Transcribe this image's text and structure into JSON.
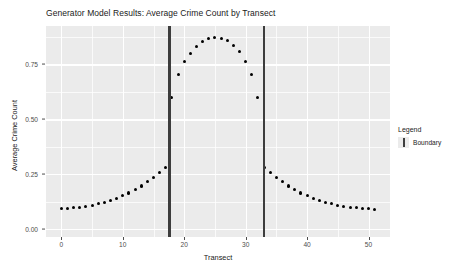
{
  "chart_data": {
    "type": "scatter",
    "title": "Generator Model Results: Average Crime Count by Transect",
    "xlabel": "Transect",
    "ylabel": "Average Crime Count",
    "xlim": [
      -2.5,
      53.5
    ],
    "ylim": [
      -0.035,
      0.925
    ],
    "xticks": [
      0,
      10,
      20,
      30,
      40,
      50
    ],
    "xtick_labels": [
      "0",
      "10",
      "20",
      "30",
      "40",
      "50"
    ],
    "yticks": [
      0.0,
      0.25,
      0.5,
      0.75
    ],
    "ytick_labels": [
      "0.00",
      "0.25",
      "0.50",
      "0.75"
    ],
    "x_minor_ticks": [
      5,
      15,
      25,
      35,
      45
    ],
    "y_minor_ticks": [
      0.125,
      0.375,
      0.625,
      0.875
    ],
    "grid": true,
    "panel_background": "#ebebeb",
    "grid_color": "#ffffff",
    "point_color": "#000000",
    "legend": {
      "title": "Legend",
      "position": "right",
      "entries": [
        {
          "label": "Boundary",
          "color": "#3d3d3d",
          "glyph": "vertical-bar"
        }
      ]
    },
    "annotations": [
      {
        "type": "vline",
        "name": "boundary-line-left",
        "x": 17.6,
        "color": "#3d3d3d"
      },
      {
        "type": "vline",
        "name": "boundary-line-right",
        "x": 33.0,
        "color": "#3d3d3d"
      }
    ],
    "series": [
      {
        "name": "Average Crime Count",
        "x": [
          0,
          1,
          2,
          3,
          4,
          5,
          6,
          7,
          8,
          9,
          10,
          11,
          12,
          13,
          14,
          15,
          16,
          17,
          18,
          19,
          20,
          21,
          22,
          23,
          24,
          25,
          26,
          27,
          28,
          29,
          30,
          31,
          32,
          33,
          34,
          35,
          36,
          37,
          38,
          39,
          40,
          41,
          42,
          43,
          44,
          45,
          46,
          47,
          48,
          49,
          50,
          51
        ],
        "y": [
          0.093,
          0.095,
          0.098,
          0.101,
          0.105,
          0.11,
          0.116,
          0.123,
          0.131,
          0.141,
          0.152,
          0.165,
          0.18,
          0.197,
          0.216,
          0.237,
          0.259,
          0.281,
          0.6,
          0.705,
          0.762,
          0.8,
          0.833,
          0.855,
          0.868,
          0.872,
          0.868,
          0.857,
          0.838,
          0.808,
          0.762,
          0.703,
          0.598,
          0.281,
          0.259,
          0.237,
          0.216,
          0.197,
          0.18,
          0.165,
          0.152,
          0.141,
          0.131,
          0.123,
          0.116,
          0.11,
          0.105,
          0.101,
          0.098,
          0.095,
          0.093,
          0.091
        ]
      }
    ]
  }
}
